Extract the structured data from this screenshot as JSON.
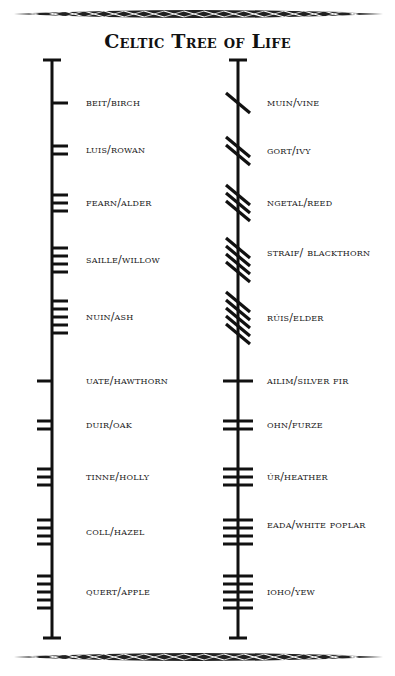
{
  "title": "Celtic Tree of Life",
  "colors": {
    "ink": "#111111",
    "background": "#ffffff"
  },
  "decorations": {
    "top_border": "celtic-knot-border",
    "bottom_border": "celtic-knot-border"
  },
  "left_column": {
    "stem_x": 52,
    "items": [
      {
        "label": "beit/birch",
        "letter": "beith",
        "strokes": 1,
        "style": "right",
        "y": 103
      },
      {
        "label": "luis/rowan",
        "letter": "luis",
        "strokes": 2,
        "style": "right",
        "y": 150
      },
      {
        "label": "fearn/alder",
        "letter": "fearn",
        "strokes": 3,
        "style": "right",
        "y": 203
      },
      {
        "label": "saille/willow",
        "letter": "saille",
        "strokes": 4,
        "style": "right",
        "y": 260
      },
      {
        "label": "nuin/ash",
        "letter": "nuin",
        "strokes": 5,
        "style": "right",
        "y": 317
      },
      {
        "label": "uate/hawthorn",
        "letter": "uath",
        "strokes": 1,
        "style": "left",
        "y": 381
      },
      {
        "label": "duir/oak",
        "letter": "duir",
        "strokes": 2,
        "style": "left",
        "y": 425
      },
      {
        "label": "tinne/holly",
        "letter": "tinne",
        "strokes": 3,
        "style": "left",
        "y": 477
      },
      {
        "label": "coll/hazel",
        "letter": "coll",
        "strokes": 4,
        "style": "left",
        "y": 532
      },
      {
        "label": "quert/apple",
        "letter": "quert",
        "strokes": 5,
        "style": "left",
        "y": 592
      }
    ]
  },
  "right_column": {
    "stem_x": 238,
    "items": [
      {
        "label": "muin/vine",
        "letter": "muin",
        "strokes": 1,
        "style": "diagonal",
        "y": 103
      },
      {
        "label": "gort/ivy",
        "letter": "gort",
        "strokes": 2,
        "style": "diagonal",
        "y": 151
      },
      {
        "label": "ngetal/reed",
        "letter": "ngetal",
        "strokes": 3,
        "style": "diagonal",
        "y": 203
      },
      {
        "label": "straif/ blackthorn",
        "letter": "straif",
        "strokes": 4,
        "style": "diagonal",
        "y": 260
      },
      {
        "label": "rúis/elder",
        "letter": "ruis",
        "strokes": 5,
        "style": "diagonal",
        "y": 318
      },
      {
        "label": "ailim/silver fir",
        "letter": "ailm",
        "strokes": 1,
        "style": "cross",
        "y": 381
      },
      {
        "label": "ohn/furze",
        "letter": "onn",
        "strokes": 2,
        "style": "cross",
        "y": 425
      },
      {
        "label": "úr/heather",
        "letter": "ur",
        "strokes": 3,
        "style": "cross",
        "y": 477
      },
      {
        "label": "eada/white poplar",
        "letter": "eadha",
        "strokes": 4,
        "style": "cross",
        "y": 532
      },
      {
        "label": "ioho/yew",
        "letter": "ioho",
        "strokes": 5,
        "style": "cross",
        "y": 592
      }
    ]
  },
  "stem": {
    "top_y": 60,
    "bottom_y": 638,
    "cap_half_width": 8
  }
}
